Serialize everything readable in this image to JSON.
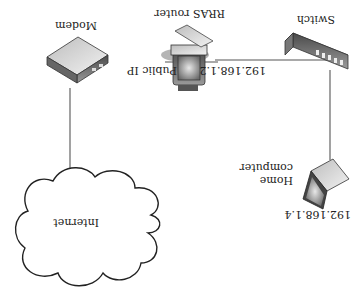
{
  "diagram": {
    "orientation": "rotated-180",
    "nodes": [
      {
        "id": "modem",
        "label": "Modem",
        "icon": "modem-icon"
      },
      {
        "id": "rras",
        "label": "RRAS router",
        "icon": "server-icon",
        "left_address": "Public IP",
        "right_address": "192.168.1.2"
      },
      {
        "id": "switch",
        "label": "Switch",
        "icon": "switch-icon"
      },
      {
        "id": "home",
        "label_line1": "Home",
        "label_line2": "computer",
        "icon": "laptop-icon",
        "address": "192.168.1.4"
      },
      {
        "id": "internet",
        "label": "Internet",
        "icon": "cloud-icon"
      }
    ],
    "edges": [
      {
        "from": "modem",
        "to": "rras"
      },
      {
        "from": "rras",
        "to": "switch"
      },
      {
        "from": "switch",
        "to": "home"
      },
      {
        "from": "modem",
        "to": "internet"
      }
    ]
  }
}
